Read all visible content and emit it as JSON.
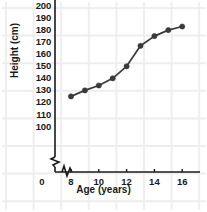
{
  "chart_data": {
    "type": "line",
    "title": "",
    "xlabel": "Age (years)",
    "ylabel": "Height (cm)",
    "x": [
      8,
      9,
      10,
      11,
      12,
      13,
      14,
      15,
      16
    ],
    "values": [
      125,
      130,
      134,
      140,
      150,
      167,
      175,
      180,
      183
    ],
    "series": [
      {
        "name": "Height",
        "values": [
          125,
          130,
          134,
          140,
          150,
          167,
          175,
          180,
          183
        ]
      }
    ],
    "xlim": [
      8,
      16
    ],
    "ylim": [
      100,
      200
    ],
    "y_ticks": [
      100,
      110,
      120,
      130,
      140,
      150,
      160,
      170,
      180,
      190,
      200
    ],
    "x_ticks": [
      8,
      10,
      12,
      14,
      16
    ],
    "x_origin_label": "0",
    "grid": true,
    "legend": "none",
    "axis_break_x": true,
    "axis_break_y": true,
    "marker": "circle",
    "colors": {
      "line": "#3a3a3a",
      "marker": "#3a3a3a",
      "axis": "#1a1a1a",
      "grid": "#eeeeee",
      "background": "#ffffff",
      "text": "#1a1a1a"
    }
  }
}
